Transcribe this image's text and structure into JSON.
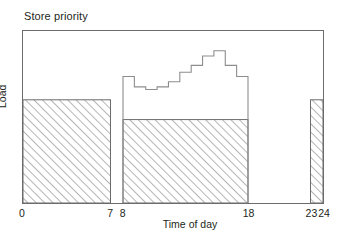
{
  "chart_data": {
    "type": "bar",
    "title": "Store priority",
    "xlabel": "Time of day",
    "ylabel": "Load",
    "xlim": [
      0,
      24
    ],
    "ylim": [
      0,
      1
    ],
    "grid": false,
    "legend": "none",
    "xticks": [
      0,
      7,
      8,
      18,
      23,
      24
    ],
    "xtick_labels": [
      "0",
      "7",
      "8",
      "18",
      "23",
      "24"
    ],
    "yticks": [],
    "ytick_labels": [],
    "series": [
      {
        "name": "Load",
        "type": "bar",
        "style": "hatched",
        "bars": [
          {
            "x_start": 0,
            "x_end": 7,
            "height": 0.6
          },
          {
            "x_start": 8,
            "x_end": 18,
            "height": 0.485
          },
          {
            "x_start": 23,
            "x_end": 24,
            "height": 0.6
          }
        ]
      },
      {
        "name": "Store priority",
        "type": "step",
        "style": "outline",
        "x_start": 8,
        "x_end": 18,
        "step_values": [
          0.735,
          0.675,
          0.66,
          0.675,
          0.705,
          0.76,
          0.8,
          0.855,
          0.885,
          0.8,
          0.735
        ]
      }
    ],
    "annotations": []
  },
  "figure": {
    "title": "Store priority",
    "x_axis_title": "Time of day",
    "y_axis_title": "Load"
  },
  "axis": {
    "ticks": [
      {
        "label": "0",
        "value": 0
      },
      {
        "label": "7",
        "value": 7
      },
      {
        "label": "8",
        "value": 8
      },
      {
        "label": "18",
        "value": 18
      },
      {
        "label": "23",
        "value": 23
      },
      {
        "label": "24",
        "value": 24
      }
    ]
  },
  "colors": {
    "frame": "#6b6b6b",
    "hatch": "#9a9a9a",
    "bar_outline": "#6b6b6b",
    "step_line": "#8a8a8a",
    "text": "#231f20",
    "background": "#ffffff"
  }
}
